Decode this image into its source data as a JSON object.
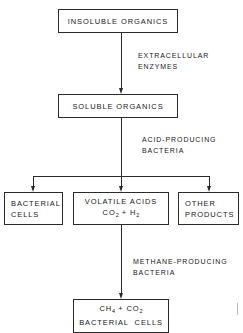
{
  "diagram": {
    "nodes": {
      "insoluble": {
        "text": "INSOLUBLE ORGANICS"
      },
      "soluble": {
        "text": "SOLUBLE ORGANICS"
      },
      "bacterial_cells": {
        "line1": "BACTERIAL",
        "line2": "CELLS"
      },
      "volatile_acids": {
        "line1": "VOLATILE ACIDS",
        "line2_a": "CO",
        "line2_sub1": "2",
        "line2_b": " + H",
        "line2_sub2": "2"
      },
      "other_products": {
        "line1": "OTHER",
        "line2": "PRODUCTS"
      },
      "methane": {
        "line1_a": "CH",
        "line1_sub1": "4",
        "line1_b": " + CO",
        "line1_sub2": "2",
        "line2": "BACTERIAL  CELLS"
      }
    },
    "edges": {
      "step1": {
        "line1": "EXTRACELLULAR",
        "line2": "ENZYMES"
      },
      "step2": {
        "line1": "ACID-PRODUCING",
        "line2": "BACTERIA"
      },
      "step3": {
        "line1": "METHANE-PRODUCING",
        "line2": "BACTERIA"
      }
    }
  }
}
